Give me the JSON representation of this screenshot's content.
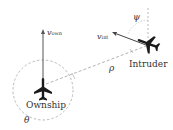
{
  "diagram": {
    "ownship_label": "Ownship",
    "intruder_label": "Intruder",
    "v_own": {
      "symbol": "v",
      "subscript": "own"
    },
    "v_int": {
      "symbol": "v",
      "subscript": "int"
    },
    "rho_label": "ρ",
    "theta_label": "θ",
    "psi_label": "ψ"
  },
  "colors": {
    "aircraft": "#1a1a1a",
    "arrow": "#555555",
    "dashed": "#aaaaaa",
    "text": "#333333"
  }
}
